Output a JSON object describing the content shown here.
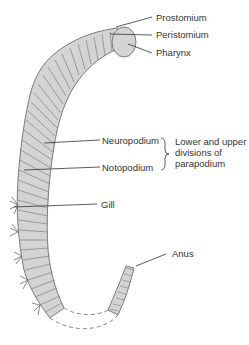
{
  "diagram": {
    "labels": {
      "prostomium": "Prostomium",
      "peristomium": "Peristomium",
      "pharynx": "Pharynx",
      "neuropodium": "Neuropodium",
      "notopodium": "Notopodium",
      "gill": "Gill",
      "anus": "Anus"
    },
    "bracket_note": {
      "line1": "Lower and upper",
      "line2": "divisions of",
      "line3": "parapodium"
    },
    "colors": {
      "body_fill": "#d4d4d4",
      "body_stroke": "#7a7a7a",
      "leader_line": "#333333",
      "text": "#333333"
    }
  }
}
